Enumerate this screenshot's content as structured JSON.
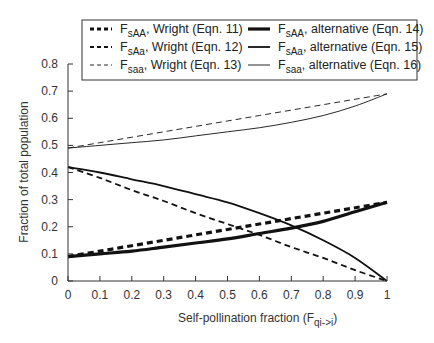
{
  "chart_data": {
    "type": "line",
    "title": "",
    "xlabel": "Self-pollination fraction (F",
    "xlabel_sub": "qi->i",
    "xlabel_close": ")",
    "ylabel": "Fraction of total population",
    "xlim": [
      0,
      1
    ],
    "ylim": [
      0,
      0.8
    ],
    "grid": false,
    "legend_position": "top",
    "x_ticks": [
      "0",
      "0.1",
      "0.2",
      "0.3",
      "0.4",
      "0.5",
      "0.6",
      "0.7",
      "0.8",
      "0.9",
      "1"
    ],
    "y_ticks": [
      "0",
      "0.1",
      "0.2",
      "0.3",
      "0.4",
      "0.5",
      "0.6",
      "0.7",
      "0.8"
    ],
    "x": [
      0,
      0.1,
      0.2,
      0.3,
      0.4,
      0.5,
      0.6,
      0.7,
      0.8,
      0.9,
      1.0
    ],
    "series": [
      {
        "name": "F_sAA, Wright (Eqn. 11)",
        "main": "F",
        "sub": "sAA",
        "rest": ", Wright (Eqn. 11)",
        "style": "thick-dashed",
        "values": [
          0.09,
          0.11,
          0.13,
          0.15,
          0.17,
          0.19,
          0.21,
          0.23,
          0.25,
          0.27,
          0.29
        ]
      },
      {
        "name": "F_sAa, Wright (Eqn. 12)",
        "main": "F",
        "sub": "sAa",
        "rest": ", Wright (Eqn. 12)",
        "style": "medium-dashed",
        "values": [
          0.42,
          0.38,
          0.335,
          0.295,
          0.25,
          0.21,
          0.17,
          0.125,
          0.085,
          0.04,
          0.0
        ]
      },
      {
        "name": "F_saa, Wright (Eqn. 13)",
        "main": "F",
        "sub": "saa",
        "rest": ", Wright (Eqn. 13)",
        "style": "thin-dashed",
        "values": [
          0.49,
          0.51,
          0.53,
          0.55,
          0.57,
          0.59,
          0.61,
          0.63,
          0.65,
          0.67,
          0.69
        ]
      },
      {
        "name": "F_sAA, alternative (Eqn. 14)",
        "main": "F",
        "sub": "sAA",
        "rest": ", alternative (Eqn. 14)",
        "style": "thick-solid",
        "values": [
          0.09,
          0.1,
          0.11,
          0.125,
          0.14,
          0.155,
          0.175,
          0.195,
          0.22,
          0.255,
          0.29
        ]
      },
      {
        "name": "F_sAa, alternative (Eqn. 15)",
        "main": "F",
        "sub": "sAa",
        "rest": ", alternative (Eqn. 15)",
        "style": "medium-solid",
        "values": [
          0.42,
          0.4,
          0.375,
          0.35,
          0.32,
          0.29,
          0.25,
          0.205,
          0.15,
          0.085,
          0.0
        ]
      },
      {
        "name": "F_saa, alternative (Eqn. 16)",
        "main": "F",
        "sub": "saa",
        "rest": ", alternative (Eqn. 16)",
        "style": "thin-solid",
        "values": [
          0.49,
          0.5,
          0.51,
          0.52,
          0.535,
          0.55,
          0.565,
          0.585,
          0.61,
          0.645,
          0.69
        ]
      }
    ]
  }
}
